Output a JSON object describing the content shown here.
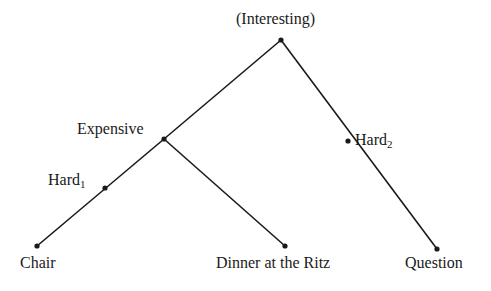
{
  "diagram": {
    "type": "tree",
    "nodes": [
      {
        "id": "interesting",
        "label": "(Interesting)",
        "x": 281,
        "y": 40
      },
      {
        "id": "expensive",
        "label": "Expensive",
        "x": 164,
        "y": 139
      },
      {
        "id": "hard2",
        "label": "Hard",
        "sub": "2",
        "x": 348,
        "y": 141
      },
      {
        "id": "hard1",
        "label": "Hard",
        "sub": "1",
        "x": 105,
        "y": 188
      },
      {
        "id": "chair",
        "label": "Chair",
        "x": 37,
        "y": 246
      },
      {
        "id": "dinner",
        "label": "Dinner at the Ritz",
        "x": 285,
        "y": 246
      },
      {
        "id": "question",
        "label": "Question",
        "x": 437,
        "y": 249
      }
    ],
    "edges": [
      [
        "interesting",
        "expensive"
      ],
      [
        "interesting",
        "question"
      ],
      [
        "expensive",
        "chair"
      ],
      [
        "expensive",
        "dinner"
      ]
    ],
    "line_color": "#1a1a1a"
  }
}
